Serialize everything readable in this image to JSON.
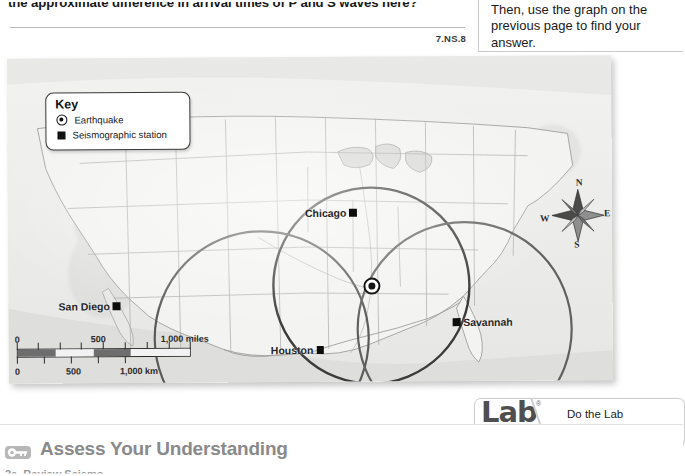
{
  "question": {
    "text": "the approximate difference in arrival times of P and S waves here?",
    "standard_code": "7.NS.8"
  },
  "instruction_box": {
    "text": "Then, use the graph on the previous page to find your answer."
  },
  "map": {
    "key": {
      "title": "Key",
      "items": [
        {
          "icon": "earthquake-bullseye-icon",
          "label": "Earthquake"
        },
        {
          "icon": "seismographic-station-square-icon",
          "label": "Seismographic station"
        }
      ]
    },
    "cities": [
      {
        "name": "Chicago",
        "marker": "station-square",
        "marker_side": "right"
      },
      {
        "name": "San Diego",
        "marker": "station-square",
        "marker_side": "right"
      },
      {
        "name": "Houston",
        "marker": "station-square",
        "marker_side": "right"
      },
      {
        "name": "Savannah",
        "marker": "station-square",
        "marker_side": "left"
      }
    ],
    "epicenter": {
      "label": "earthquake-epicenter",
      "x": 363,
      "y": 229
    },
    "circles": [
      {
        "station": "Chicago",
        "cx": 363,
        "cy": 229,
        "r": 98,
        "color": "#3b3b3b"
      },
      {
        "station": "Houston",
        "cx": 363,
        "cy": 229,
        "r": 105,
        "color": "#595959"
      },
      {
        "station": "Savannah",
        "cx": 363,
        "cy": 229,
        "r": 105,
        "color": "#5f5f5f"
      }
    ],
    "compass": {
      "north": "N",
      "east": "E",
      "south": "S",
      "west": "W"
    },
    "scale": {
      "miles": {
        "unit": "1,000 miles",
        "ticks": [
          "0",
          "500",
          "1,000 miles"
        ]
      },
      "km": {
        "unit": "1,000 km",
        "ticks": [
          "0",
          "500",
          "1,000 km"
        ]
      }
    }
  },
  "lab_zone": {
    "logo_word": "Lab",
    "registered_mark": "®",
    "logo_sub": "zone",
    "line1": "Do the Lab Investigation",
    "line2": "Finding the Epicenter."
  },
  "assess": {
    "icon": "key-icon",
    "title": "Assess Your Understanding",
    "subitem": "2a. Review  Seismo"
  },
  "colors": {
    "page_background": "#ffffff",
    "map_paper": "#eaeae8",
    "ink": "#1a1a1a",
    "assess_gray": "#8a8a8a",
    "circle_dark": "#3b3b3b"
  }
}
